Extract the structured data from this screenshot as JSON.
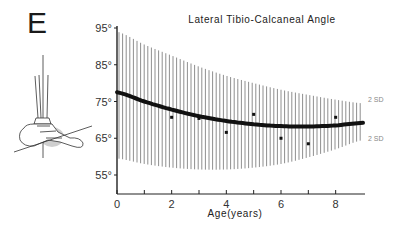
{
  "panel_label": "E",
  "chart_data": {
    "type": "line",
    "title": "Lateral Tibio-Calcaneal Angle",
    "xlabel": "Age(years)",
    "ylabel": "",
    "xlim": [
      0,
      9
    ],
    "ylim": [
      50,
      95
    ],
    "x_ticks": [
      0,
      1,
      2,
      3,
      4,
      5,
      6,
      7,
      8
    ],
    "x_tick_labels": [
      "0",
      "",
      "2",
      "",
      "4",
      "",
      "6",
      "",
      "8"
    ],
    "y_ticks": [
      95,
      85,
      75,
      65,
      55
    ],
    "y_tick_labels": [
      "95°",
      "85°",
      "75°",
      "65°",
      "55°"
    ],
    "grid": false,
    "series": [
      {
        "name": "Mean (fitted curve)",
        "style": "thick-line",
        "x": [
          0,
          1,
          2,
          3,
          4,
          5,
          6,
          7,
          8,
          9
        ],
        "values": [
          77.5,
          75.0,
          72.8,
          71.0,
          69.7,
          68.8,
          68.3,
          68.2,
          68.5,
          69.2
        ]
      },
      {
        "name": "+2 SD",
        "style": "band-upper",
        "x": [
          0,
          1,
          2,
          3,
          4,
          5,
          6,
          7,
          8,
          9
        ],
        "values": [
          94.0,
          90.5,
          87.5,
          84.5,
          82.0,
          80.0,
          78.2,
          76.8,
          75.5,
          74.5
        ]
      },
      {
        "name": "-2 SD",
        "style": "band-lower",
        "x": [
          0,
          1,
          2,
          3,
          4,
          5,
          6,
          7,
          8,
          9
        ],
        "values": [
          59.5,
          58.0,
          57.0,
          56.5,
          56.5,
          57.0,
          58.0,
          59.8,
          62.0,
          64.5
        ]
      },
      {
        "name": "Observed means",
        "style": "points",
        "x": [
          1,
          2,
          3,
          4,
          5,
          6,
          7,
          8
        ],
        "values": [
          75.0,
          70.7,
          70.4,
          66.6,
          71.5,
          65.0,
          63.5,
          70.7
        ]
      }
    ],
    "annotations": [
      {
        "text": "2 SD",
        "position": "right of upper band"
      },
      {
        "text": "2 SD",
        "position": "right of lower band"
      }
    ],
    "inset": "lateral ankle/foot diagram showing tibial axis and calcaneal axis lines"
  },
  "labels": {
    "sd_upper": "2 SD",
    "sd_lower": "2 SD"
  }
}
